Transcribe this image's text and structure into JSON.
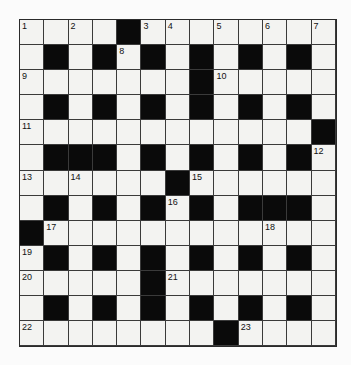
{
  "puzzle": {
    "rows": 13,
    "cols": 13,
    "layout": [
      "....#........",
      ".#.#.#.#.#.#.",
      ".......#.....",
      ".#.#.#.#.#.#.",
      "............#",
      ".###.#.#.#.#.",
      "......#......",
      ".#.#.#.#.###.",
      "#............",
      ".#.#.#.#.#.#.",
      ".....#.......",
      ".#.#.#.#.#.#.",
      "........#...."
    ],
    "numbers": [
      {
        "r": 0,
        "c": 0,
        "n": "1"
      },
      {
        "r": 0,
        "c": 2,
        "n": "2"
      },
      {
        "r": 0,
        "c": 5,
        "n": "3"
      },
      {
        "r": 0,
        "c": 6,
        "n": "4"
      },
      {
        "r": 0,
        "c": 8,
        "n": "5"
      },
      {
        "r": 0,
        "c": 10,
        "n": "6"
      },
      {
        "r": 0,
        "c": 12,
        "n": "7"
      },
      {
        "r": 1,
        "c": 4,
        "n": "8"
      },
      {
        "r": 2,
        "c": 0,
        "n": "9"
      },
      {
        "r": 2,
        "c": 8,
        "n": "10"
      },
      {
        "r": 4,
        "c": 0,
        "n": "11"
      },
      {
        "r": 5,
        "c": 12,
        "n": "12"
      },
      {
        "r": 6,
        "c": 0,
        "n": "13"
      },
      {
        "r": 6,
        "c": 2,
        "n": "14"
      },
      {
        "r": 6,
        "c": 7,
        "n": "15"
      },
      {
        "r": 7,
        "c": 6,
        "n": "16"
      },
      {
        "r": 8,
        "c": 1,
        "n": "17"
      },
      {
        "r": 8,
        "c": 10,
        "n": "18"
      },
      {
        "r": 9,
        "c": 0,
        "n": "19"
      },
      {
        "r": 10,
        "c": 0,
        "n": "20"
      },
      {
        "r": 10,
        "c": 6,
        "n": "21"
      },
      {
        "r": 12,
        "c": 0,
        "n": "22"
      },
      {
        "r": 12,
        "c": 9,
        "n": "23"
      }
    ],
    "colors": {
      "block": "#0a0a0a",
      "cell": "#f3f3f1",
      "line": "#3a3a3a"
    }
  }
}
